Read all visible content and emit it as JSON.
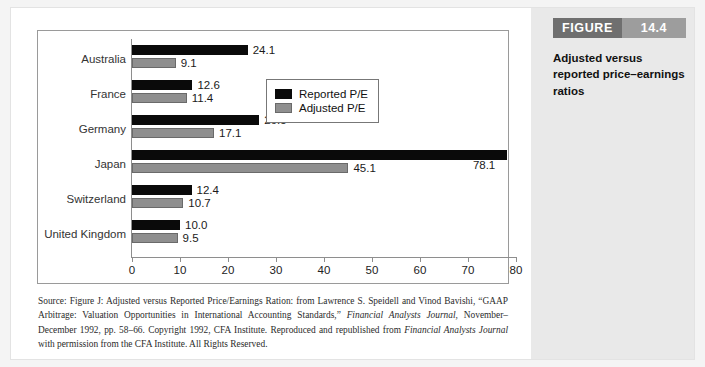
{
  "figure": {
    "tag_word": "FIGURE",
    "tag_number": "14.4",
    "caption": "Adjusted versus reported price–earnings ratios"
  },
  "chart_data": {
    "type": "bar",
    "orientation": "horizontal",
    "title": "Adjusted versus reported price–earnings ratios",
    "xlabel": "",
    "ylabel": "",
    "xlim": [
      0,
      80
    ],
    "xticks": [
      0,
      10,
      20,
      30,
      40,
      50,
      60,
      70,
      80
    ],
    "grid": false,
    "legend_position": "upper right",
    "categories": [
      "Australia",
      "France",
      "Germany",
      "Japan",
      "Switzerland",
      "United Kingdom"
    ],
    "series": [
      {
        "name": "Reported P/E",
        "color": "#0a0a0a",
        "values": [
          24.1,
          12.6,
          26.5,
          78.1,
          12.4,
          10.0
        ],
        "labels": [
          "24.1",
          "12.6",
          "26.5",
          "78.1",
          "12.4",
          "10.0"
        ]
      },
      {
        "name": "Adjusted P/E",
        "color": "#8f8f8f",
        "values": [
          9.1,
          11.4,
          17.1,
          45.1,
          10.7,
          9.5
        ],
        "labels": [
          "9.1",
          "11.4",
          "17.1",
          "45.1",
          "10.7",
          "9.5"
        ]
      }
    ]
  },
  "source": {
    "line": "Source: Figure J: Adjusted versus Reported Price/Earnings Ration: from Lawrence S. Speidell and Vinod Bavishi, “GAAP Arbitrage: Valuation Opportunities in International Accounting Standards,” ",
    "italic1": "Financial Analysts Journal,",
    "mid": " November–December 1992, pp. 58–66. Copyright 1992, CFA Institute. Reproduced and republished from ",
    "italic2": "Financial Analysts Journal",
    "tail": " with permission from the CFA Institute. All Rights Reserved."
  }
}
